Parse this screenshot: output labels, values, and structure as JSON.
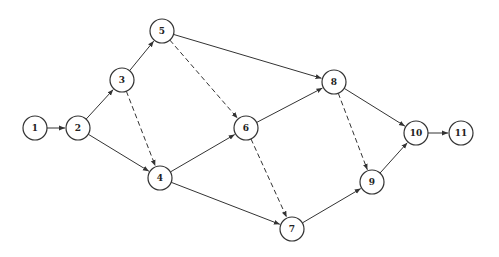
{
  "diagram": {
    "type": "network-graph",
    "node_radius": 12,
    "stroke_color": "#333333",
    "nodes": [
      {
        "id": "1",
        "label": "1",
        "x": 35,
        "y": 128
      },
      {
        "id": "2",
        "label": "2",
        "x": 78,
        "y": 128
      },
      {
        "id": "3",
        "label": "3",
        "x": 122,
        "y": 80
      },
      {
        "id": "4",
        "label": "4",
        "x": 160,
        "y": 178
      },
      {
        "id": "5",
        "label": "5",
        "x": 162,
        "y": 31
      },
      {
        "id": "6",
        "label": "6",
        "x": 246,
        "y": 128
      },
      {
        "id": "7",
        "label": "7",
        "x": 292,
        "y": 229
      },
      {
        "id": "8",
        "label": "8",
        "x": 334,
        "y": 82
      },
      {
        "id": "9",
        "label": "9",
        "x": 372,
        "y": 182
      },
      {
        "id": "10",
        "label": "10",
        "x": 416,
        "y": 133
      },
      {
        "id": "11",
        "label": "11",
        "x": 461,
        "y": 133
      }
    ],
    "edges": [
      {
        "from": "1",
        "to": "2",
        "style": "solid"
      },
      {
        "from": "2",
        "to": "3",
        "style": "solid"
      },
      {
        "from": "2",
        "to": "4",
        "style": "solid"
      },
      {
        "from": "3",
        "to": "5",
        "style": "solid"
      },
      {
        "from": "3",
        "to": "4",
        "style": "dashed"
      },
      {
        "from": "5",
        "to": "8",
        "style": "solid"
      },
      {
        "from": "5",
        "to": "6",
        "style": "dashed"
      },
      {
        "from": "4",
        "to": "6",
        "style": "solid"
      },
      {
        "from": "4",
        "to": "7",
        "style": "solid"
      },
      {
        "from": "6",
        "to": "8",
        "style": "solid"
      },
      {
        "from": "6",
        "to": "7",
        "style": "dashed"
      },
      {
        "from": "8",
        "to": "10",
        "style": "solid"
      },
      {
        "from": "8",
        "to": "9",
        "style": "dashed"
      },
      {
        "from": "7",
        "to": "9",
        "style": "solid"
      },
      {
        "from": "9",
        "to": "10",
        "style": "solid"
      },
      {
        "from": "10",
        "to": "11",
        "style": "solid"
      }
    ]
  }
}
